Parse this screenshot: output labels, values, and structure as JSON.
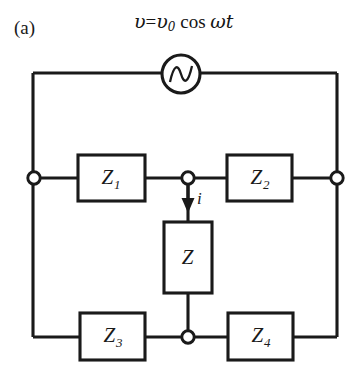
{
  "figure": {
    "panel_label": "(a)",
    "source_equation": {
      "lhs": "υ",
      "equals": "=",
      "amplitude": "υ",
      "amplitude_subscript": "0",
      "cos": "cos",
      "omega": "ω",
      "time": "t",
      "full_text": "υ = υ₀ cos ω t"
    },
    "background_color": "#ffffff",
    "line_color": "#1a1a1a"
  },
  "components": {
    "ac_source": {
      "name": "ac-voltage-source",
      "symbol": "sine-wave-in-circle"
    },
    "impedances": [
      {
        "id": "Z1",
        "label": "Z",
        "subscript": "1",
        "orientation": "horizontal",
        "position": "top-left-branch"
      },
      {
        "id": "Z2",
        "label": "Z",
        "subscript": "2",
        "orientation": "horizontal",
        "position": "top-right-branch"
      },
      {
        "id": "Z",
        "label": "Z",
        "subscript": "",
        "orientation": "vertical",
        "position": "bridge-center"
      },
      {
        "id": "Z3",
        "label": "Z",
        "subscript": "3",
        "orientation": "horizontal",
        "position": "bottom-left-branch"
      },
      {
        "id": "Z4",
        "label": "Z",
        "subscript": "4",
        "orientation": "horizontal",
        "position": "bottom-right-branch"
      }
    ],
    "current": {
      "label": "i",
      "direction": "downward",
      "through": "Z"
    },
    "nodes": [
      {
        "id": "left-terminal",
        "cx": 34,
        "cy": 178
      },
      {
        "id": "center-top-node",
        "cx": 188,
        "cy": 178
      },
      {
        "id": "right-terminal",
        "cx": 337,
        "cy": 178
      },
      {
        "id": "center-bottom-node",
        "cx": 188,
        "cy": 337
      }
    ]
  }
}
